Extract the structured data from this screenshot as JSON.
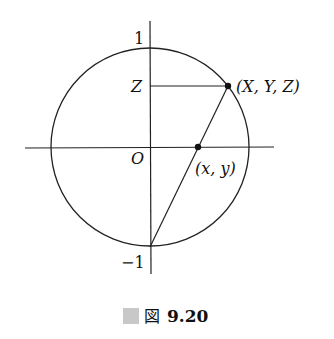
{
  "diagram": {
    "axis_labels": {
      "top": "1",
      "bottom": "−1",
      "z": "Z",
      "origin": "O"
    },
    "points": {
      "sphere_point": "(X, Y, Z)",
      "projected_point": "(x, y)"
    },
    "caption": {
      "marker_color": "#c8c8c8",
      "kanji": "図",
      "number": "9.20"
    },
    "colors": {
      "stroke": "#222222",
      "background": "#ffffff"
    }
  }
}
